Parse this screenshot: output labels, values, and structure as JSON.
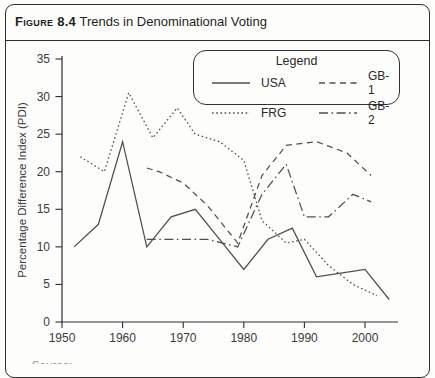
{
  "figure": {
    "label": "Figure 8.4",
    "title": "Trends in Denominational Voting"
  },
  "legend": {
    "title": "Legend",
    "entries": [
      {
        "label": "USA",
        "style": "solid"
      },
      {
        "label": "GB-1",
        "style": "dashed"
      },
      {
        "label": "FRG",
        "style": "dotted"
      },
      {
        "label": "GB-2",
        "style": "dashdot"
      }
    ]
  },
  "footer_partial": "Source:",
  "colors": {
    "line": "#4f4f4f",
    "text": "#3b3b3b",
    "border": "#2e2e2e"
  },
  "chart_data": {
    "type": "line",
    "title": "Figure 8.4 Trends in Denominational Voting",
    "xlabel": "",
    "ylabel": "Percentage Difference Index (PDI)",
    "xlim": [
      1948,
      2006
    ],
    "ylim": [
      0,
      35
    ],
    "x_ticks": [
      1950,
      1960,
      1970,
      1980,
      1990,
      2000
    ],
    "y_ticks": [
      0,
      5,
      10,
      15,
      20,
      25,
      30,
      35
    ],
    "grid": false,
    "legend_position": "top-right-inside",
    "series": [
      {
        "name": "USA",
        "style": "solid",
        "points": [
          [
            1952,
            10
          ],
          [
            1956,
            13
          ],
          [
            1960,
            24
          ],
          [
            1964,
            10
          ],
          [
            1968,
            14
          ],
          [
            1972,
            15
          ],
          [
            1976,
            11
          ],
          [
            1980,
            7
          ],
          [
            1984,
            11
          ],
          [
            1988,
            12.5
          ],
          [
            1992,
            6
          ],
          [
            1996,
            6.5
          ],
          [
            2000,
            7
          ],
          [
            2004,
            3
          ]
        ]
      },
      {
        "name": "FRG",
        "style": "dotted",
        "points": [
          [
            1953,
            22
          ],
          [
            1957,
            20
          ],
          [
            1961,
            30.5
          ],
          [
            1965,
            24.5
          ],
          [
            1969,
            28.5
          ],
          [
            1972,
            25
          ],
          [
            1976,
            24
          ],
          [
            1980,
            21.5
          ],
          [
            1983,
            13.5
          ],
          [
            1987,
            10.5
          ],
          [
            1990,
            11
          ],
          [
            1994,
            7.5
          ],
          [
            1998,
            5
          ],
          [
            2002,
            3.5
          ]
        ]
      },
      {
        "name": "GB-1",
        "style": "dashed",
        "points": [
          [
            1964,
            20.5
          ],
          [
            1966,
            20
          ],
          [
            1970,
            18.5
          ],
          [
            1974,
            15.5
          ],
          [
            1979,
            10.5
          ],
          [
            1983,
            19.5
          ],
          [
            1987,
            23.5
          ],
          [
            1992,
            24
          ],
          [
            1997,
            22.5
          ],
          [
            2001,
            19.5
          ]
        ]
      },
      {
        "name": "GB-2",
        "style": "dashdot",
        "points": [
          [
            1964,
            11
          ],
          [
            1966,
            11
          ],
          [
            1970,
            11
          ],
          [
            1974,
            11
          ],
          [
            1979,
            10
          ],
          [
            1983,
            17
          ],
          [
            1987,
            21
          ],
          [
            1990,
            14
          ],
          [
            1994,
            14
          ],
          [
            1998,
            17
          ],
          [
            2001,
            16
          ]
        ]
      }
    ]
  }
}
